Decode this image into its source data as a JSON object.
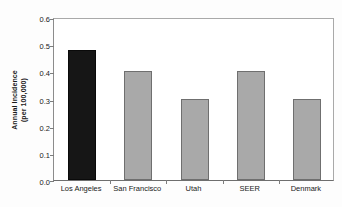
{
  "chart_data": {
    "type": "bar",
    "title": "",
    "xlabel": "",
    "ylabel": "Annual Incidence (per 100,000)",
    "ylabel_line1": "Annual Incidence",
    "ylabel_line2": "(per 100,000)",
    "categories": [
      "Los Angeles",
      "San Francisco",
      "Utah",
      "SEER",
      "Denmark"
    ],
    "values": [
      0.48,
      0.4,
      0.3,
      0.4,
      0.3
    ],
    "bar_colors": [
      "#161616",
      "#a9a9a9",
      "#a9a9a9",
      "#a9a9a9",
      "#a9a9a9"
    ],
    "ylim": [
      0.0,
      0.6
    ],
    "ytick_labels": [
      "0.0",
      "0.1",
      "0.2",
      "0.3",
      "0.4",
      "0.5",
      "0.6"
    ],
    "ytick_values": [
      0.0,
      0.1,
      0.2,
      0.3,
      0.4,
      0.5,
      0.6
    ],
    "grid": false,
    "legend": false,
    "legend_position": "none",
    "frame": true,
    "highlight_category": "Los Angeles"
  },
  "colors": {
    "highlight_bar": "#161616",
    "default_bar": "#a9a9a9",
    "bar_border": "#6f6f6f",
    "axis": "#8c8c8c",
    "text": "#1a1a1a",
    "background": "#fdfdfd"
  }
}
